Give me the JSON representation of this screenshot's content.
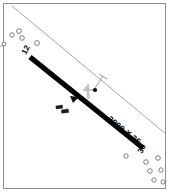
{
  "diagram": {
    "kind": "airport-runway-diagram",
    "frame": {
      "stroke": "#8c8c8c",
      "x": 3.5,
      "y": 3.5,
      "width": 162,
      "height": 185
    },
    "runway": {
      "name": "runway-12-30",
      "dimension_label": "3000 X 35",
      "length_ft": 3000,
      "width_ft": 35,
      "color": "#000000",
      "thickness": 5.2,
      "ends": [
        {
          "designator": "12",
          "x": 30,
          "y": 57,
          "label_x": 26,
          "label_y": 55,
          "rotation": -62
        },
        {
          "designator": "30",
          "x": 143,
          "y": 148,
          "label_x": 142,
          "label_y": 154,
          "rotation": -62
        }
      ],
      "dimension_label_pos": {
        "x": 107,
        "y": 120,
        "rotation": 39
      }
    },
    "boundary": {
      "name": "property-boundary-line",
      "color": "#9a9a9a",
      "from": {
        "x": 12,
        "y": 6
      },
      "to": {
        "x": 166,
        "y": 134
      }
    },
    "reference_point": {
      "name": "airport-reference-point",
      "x": 95,
      "y": 90,
      "radius": 2.1,
      "color": "#000000"
    },
    "reference_leader": {
      "from": {
        "x": 95,
        "y": 88
      },
      "to": {
        "x": 102,
        "y": 77
      },
      "tick_to": {
        "x": 108,
        "y": 74
      },
      "color": "#7d7d7d"
    },
    "windsock": {
      "name": "windsock-segmented-circle",
      "x": 88,
      "y": 92,
      "color": "#b4b4b4"
    },
    "taxiway_wedge": {
      "name": "taxiway-connector",
      "points": "70,96 79,97 73,103"
    },
    "buildings": [
      {
        "name": "building-hangar-1",
        "x": 57,
        "y": 106,
        "width": 6.5,
        "height": 3.2,
        "rotation": -8
      },
      {
        "name": "building-hangar-2",
        "x": 62,
        "y": 110,
        "width": 7.0,
        "height": 3.4,
        "rotation": -8
      }
    ],
    "obstacles": [
      {
        "x": 12,
        "y": 35,
        "r": 2.2
      },
      {
        "x": 19,
        "y": 31,
        "r": 2.4
      },
      {
        "x": 22,
        "y": 38,
        "r": 2.3
      },
      {
        "x": 37,
        "y": 43,
        "r": 2.4
      },
      {
        "x": 4,
        "y": 44,
        "r": 1.9
      },
      {
        "x": 126,
        "y": 156,
        "r": 2.2
      },
      {
        "x": 146,
        "y": 162,
        "r": 2.3
      },
      {
        "x": 158,
        "y": 158,
        "r": 2.3
      },
      {
        "x": 150,
        "y": 171,
        "r": 2.3
      },
      {
        "x": 161,
        "y": 170,
        "r": 2.2
      },
      {
        "x": 154,
        "y": 180,
        "r": 2.2
      },
      {
        "x": 163,
        "y": 182,
        "r": 2.1
      }
    ],
    "edge_ticks": [
      {
        "x1": 0,
        "y1": 46,
        "x2": 3.5,
        "y2": 46
      }
    ],
    "colors": {
      "frame": "#8c8c8c",
      "runway": "#000000",
      "boundary": "#9a9a9a",
      "obstacle_stroke": "#5c5c5c",
      "windsock": "#b4b4b4",
      "background": "#ffffff"
    }
  }
}
